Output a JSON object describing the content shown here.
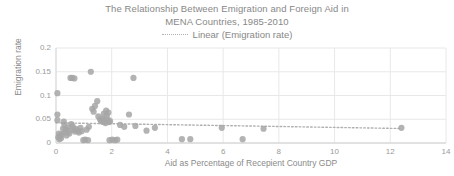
{
  "chart": {
    "title_line1": "The Relationship Between Emigration and Foreign Aid in",
    "title_line2": "MENA Countries, 1985-2010",
    "legend_label": "Linear (Emigration rate)",
    "ylabel": "Emigration rate",
    "xlabel": "Aid as Percentage of Recepient Country GDP",
    "marker_color": "#a6a6a6",
    "gridline_color": "#e8e8e8",
    "trendline_color": "#b0b0b0",
    "text_color": "#888888"
  },
  "chart_data": {
    "type": "scatter",
    "title": "The Relationship Between Emigration and Foreign Aid in MENA Countries, 1985-2010",
    "xlabel": "Aid as Percentage of Recepient Country GDP",
    "ylabel": "Emigration rate",
    "xlim": [
      0,
      14
    ],
    "ylim": [
      0,
      0.2
    ],
    "xticks": [
      0,
      2,
      4,
      6,
      8,
      10,
      12,
      14
    ],
    "yticks": [
      0,
      0.05,
      0.1,
      0.15,
      0.2
    ],
    "ytick_labels": [
      "0",
      "0.05",
      "0.1",
      "0.15",
      "0.2"
    ],
    "grid": true,
    "legend": [
      "Linear (Emigration rate)"
    ],
    "legend_position": "top-center",
    "series": [
      {
        "name": "Emigration rate",
        "type": "scatter",
        "points": [
          [
            0.05,
            0.105
          ],
          [
            0.05,
            0.06
          ],
          [
            0.05,
            0.048
          ],
          [
            0.08,
            0.012
          ],
          [
            0.1,
            0.02
          ],
          [
            0.12,
            0.008
          ],
          [
            0.15,
            0.015
          ],
          [
            0.18,
            0.01
          ],
          [
            0.2,
            0.018
          ],
          [
            0.25,
            0.03
          ],
          [
            0.28,
            0.045
          ],
          [
            0.3,
            0.038
          ],
          [
            0.32,
            0.022
          ],
          [
            0.35,
            0.028
          ],
          [
            0.38,
            0.016
          ],
          [
            0.42,
            0.033
          ],
          [
            0.45,
            0.026
          ],
          [
            0.48,
            0.02
          ],
          [
            0.52,
            0.137
          ],
          [
            0.58,
            0.137
          ],
          [
            0.66,
            0.136
          ],
          [
            0.55,
            0.04
          ],
          [
            0.6,
            0.035
          ],
          [
            0.62,
            0.028
          ],
          [
            0.68,
            0.024
          ],
          [
            0.72,
            0.03
          ],
          [
            0.78,
            0.026
          ],
          [
            0.82,
            0.022
          ],
          [
            0.88,
            0.032
          ],
          [
            0.92,
            0.025
          ],
          [
            0.98,
            0.006
          ],
          [
            1.05,
            0.007
          ],
          [
            1.15,
            0.006
          ],
          [
            1.1,
            0.028
          ],
          [
            1.18,
            0.034
          ],
          [
            1.25,
            0.15
          ],
          [
            1.3,
            0.072
          ],
          [
            1.35,
            0.066
          ],
          [
            1.4,
            0.078
          ],
          [
            1.48,
            0.088
          ],
          [
            1.52,
            0.056
          ],
          [
            1.58,
            0.05
          ],
          [
            1.62,
            0.046
          ],
          [
            1.66,
            0.052
          ],
          [
            1.7,
            0.044
          ],
          [
            1.74,
            0.048
          ],
          [
            1.78,
            0.042
          ],
          [
            1.82,
            0.058
          ],
          [
            1.86,
            0.05
          ],
          [
            1.9,
            0.044
          ],
          [
            1.94,
            0.046
          ],
          [
            1.72,
            0.062
          ],
          [
            1.8,
            0.068
          ],
          [
            1.88,
            0.064
          ],
          [
            1.92,
            0.006
          ],
          [
            2.02,
            0.007
          ],
          [
            2.12,
            0.006
          ],
          [
            2.2,
            0.007
          ],
          [
            2.3,
            0.038
          ],
          [
            2.45,
            0.034
          ],
          [
            2.62,
            0.06
          ],
          [
            2.78,
            0.137
          ],
          [
            2.85,
            0.036
          ],
          [
            3.25,
            0.026
          ],
          [
            3.55,
            0.032
          ],
          [
            4.52,
            0.008
          ],
          [
            4.82,
            0.008
          ],
          [
            5.95,
            0.032
          ],
          [
            6.7,
            0.008
          ],
          [
            7.45,
            0.03
          ],
          [
            12.4,
            0.032
          ]
        ]
      },
      {
        "name": "Linear (Emigration rate)",
        "type": "line",
        "style": "dotted",
        "x_start": 0.0,
        "y_start": 0.0425,
        "x_end": 12.4,
        "y_end": 0.0305
      }
    ]
  }
}
